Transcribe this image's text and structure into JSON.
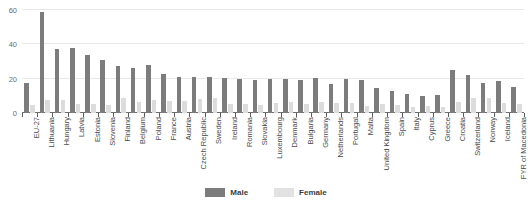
{
  "chart_data": {
    "type": "bar",
    "title": "",
    "xlabel": "",
    "ylabel": "",
    "ylim": [
      0,
      60
    ],
    "yticks": [
      0,
      20,
      40,
      60
    ],
    "grid": true,
    "legend_position": "bottom-center",
    "colors": {
      "male": "#7c7c7c",
      "female": "#dcdcdc"
    },
    "categories": [
      "EU-27",
      "Lithuania",
      "Hungary",
      "Latvia",
      "Estonia",
      "Slovenia",
      "Finland",
      "Belgium",
      "Poland",
      "France",
      "Austria",
      "Czech Republic",
      "Sweden",
      "Ireland",
      "Romania",
      "Slovakia",
      "Luxembourg",
      "Denmark",
      "Bulgaria",
      "Germany",
      "Netherlands",
      "Portugal",
      "Malta",
      "United Kingdom",
      "Spain",
      "Italy",
      "Cyprus",
      "Greece",
      "Croatia",
      "Switzerland",
      "Norway",
      "Iceland",
      "FYR of Macedonia"
    ],
    "series": [
      {
        "name": "Male",
        "values": [
          17.2,
          59.0,
          37.5,
          37.8,
          34.0,
          31.0,
          27.5,
          26.5,
          28.2,
          23.0,
          21.0,
          21.0,
          21.0,
          20.5,
          20.0,
          19.0,
          20.0,
          20.0,
          19.5,
          20.5,
          17.0,
          20.0,
          19.5,
          14.5,
          13.0,
          11.0,
          10.0,
          10.5,
          25.0,
          22.0,
          17.5,
          18.5,
          15.0
        ]
      },
      {
        "name": "Female",
        "values": [
          4.8,
          7.8,
          7.5,
          5.5,
          5.2,
          4.8,
          8.8,
          6.5,
          7.5,
          7.0,
          7.2,
          8.2,
          9.0,
          5.2,
          5.5,
          4.8,
          6.0,
          6.5,
          5.5,
          6.5,
          6.0,
          6.0,
          4.0,
          5.0,
          4.5,
          3.5,
          4.0,
          3.5,
          6.5,
          8.5,
          8.5,
          6.0,
          5.5
        ]
      }
    ]
  },
  "legend": {
    "items": [
      {
        "label": "Male"
      },
      {
        "label": "Female"
      }
    ]
  }
}
